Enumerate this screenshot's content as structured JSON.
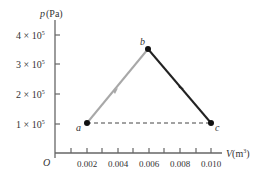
{
  "diagram": {
    "type": "pV-diagram",
    "y_axis": {
      "label_var": "p",
      "label_unit": "(Pa)",
      "ticks": [
        {
          "label": "1 × 10",
          "exp": "5",
          "value": 100000
        },
        {
          "label": "2 × 10",
          "exp": "5",
          "value": 200000
        },
        {
          "label": "3 × 10",
          "exp": "5",
          "value": 300000
        },
        {
          "label": "4 × 10",
          "exp": "5",
          "value": 400000
        }
      ]
    },
    "x_axis": {
      "label_var": "V",
      "label_unit_pre": "(m",
      "label_unit_exp": "3",
      "label_unit_post": ")",
      "origin_label": "O",
      "ticks": [
        "0.002",
        "0.004",
        "0.006",
        "0.008",
        "0.010"
      ]
    },
    "points": [
      {
        "name": "a",
        "V": 0.002,
        "p": 100000
      },
      {
        "name": "b",
        "V": 0.006,
        "p": 350000
      },
      {
        "name": "c",
        "V": 0.01,
        "p": 100000
      }
    ],
    "paths": [
      {
        "from": "a",
        "to": "b",
        "style": "solid-gray",
        "arrow": true
      },
      {
        "from": "b",
        "to": "c",
        "style": "solid-black",
        "arrow": true
      },
      {
        "from": "a",
        "to": "c",
        "style": "dashed",
        "arrow": false
      }
    ],
    "colors": {
      "axis": "#555555",
      "ab": "#a8a8a8",
      "bc": "#222222",
      "dash": "#444444"
    }
  }
}
